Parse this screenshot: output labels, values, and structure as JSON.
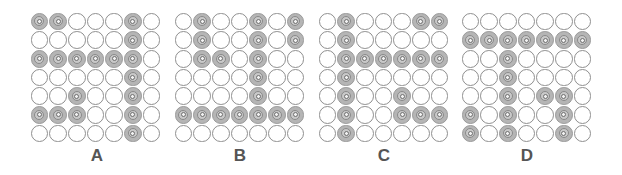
{
  "figure": {
    "panels": [
      {
        "label": "A",
        "rows": [
          [
            1,
            1,
            0,
            0,
            0,
            1,
            0
          ],
          [
            0,
            0,
            0,
            0,
            0,
            1,
            0
          ],
          [
            1,
            1,
            1,
            1,
            1,
            1,
            0
          ],
          [
            0,
            0,
            0,
            0,
            0,
            1,
            0
          ],
          [
            0,
            0,
            1,
            0,
            0,
            1,
            0
          ],
          [
            1,
            1,
            1,
            0,
            0,
            1,
            0
          ],
          [
            0,
            0,
            0,
            0,
            0,
            1,
            0
          ]
        ]
      },
      {
        "label": "B",
        "rows": [
          [
            0,
            1,
            0,
            0,
            1,
            0,
            1
          ],
          [
            0,
            1,
            0,
            0,
            1,
            0,
            1
          ],
          [
            0,
            1,
            1,
            0,
            1,
            0,
            0
          ],
          [
            0,
            0,
            0,
            0,
            1,
            0,
            0
          ],
          [
            0,
            0,
            0,
            0,
            1,
            0,
            0
          ],
          [
            1,
            1,
            1,
            1,
            1,
            1,
            1
          ],
          [
            0,
            0,
            0,
            0,
            0,
            0,
            0
          ]
        ]
      },
      {
        "label": "C",
        "rows": [
          [
            0,
            1,
            0,
            0,
            0,
            1,
            1
          ],
          [
            0,
            1,
            0,
            0,
            0,
            0,
            0
          ],
          [
            0,
            1,
            1,
            1,
            1,
            1,
            1
          ],
          [
            0,
            1,
            0,
            0,
            0,
            0,
            0
          ],
          [
            0,
            1,
            0,
            0,
            1,
            0,
            0
          ],
          [
            0,
            1,
            0,
            0,
            1,
            1,
            1
          ],
          [
            0,
            1,
            0,
            0,
            0,
            0,
            0
          ]
        ]
      },
      {
        "label": "D",
        "rows": [
          [
            0,
            0,
            0,
            0,
            0,
            0,
            0
          ],
          [
            1,
            1,
            1,
            1,
            1,
            1,
            1
          ],
          [
            0,
            0,
            1,
            0,
            0,
            0,
            0
          ],
          [
            0,
            0,
            1,
            0,
            0,
            0,
            0
          ],
          [
            0,
            0,
            1,
            0,
            1,
            1,
            0
          ],
          [
            1,
            0,
            1,
            0,
            0,
            1,
            0
          ],
          [
            1,
            0,
            1,
            0,
            0,
            1,
            0
          ]
        ]
      }
    ],
    "colors": {
      "filled_disc": "#b5b5b5",
      "empty_disc": "#ffffff",
      "disc_outline": "#8f8f8f",
      "label_text": "#555555"
    }
  }
}
